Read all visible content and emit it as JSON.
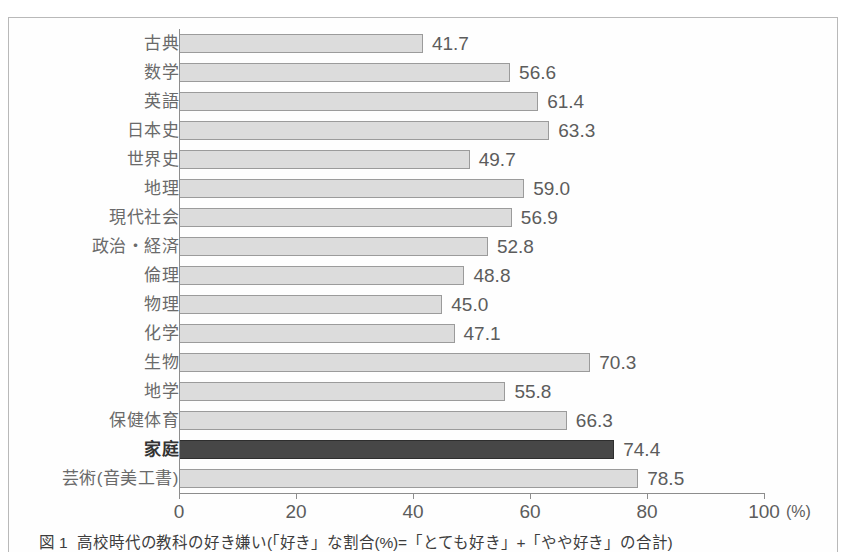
{
  "figure": {
    "caption_number": "図 1",
    "caption_text": "高校時代の教科の好き嫌い(「好き」な割合(%)=「とても好き」+「やや好き」の合計)",
    "highlight_color": "#474747",
    "bar_color": "#dcdcdc",
    "bar_border_color": "#9b9b9b",
    "axis_color": "#8d8d8d"
  },
  "chart_data": {
    "type": "bar",
    "orientation": "horizontal",
    "title": "高校時代の教科の好き嫌い(「好き」な割合(%)=「とても好き」+「やや好き」の合計)",
    "xlabel": "(%)",
    "ylabel": "",
    "xlim": [
      0,
      100
    ],
    "grid": false,
    "legend": "none",
    "unit": "(%)",
    "xticks": [
      "0",
      "20",
      "40",
      "60",
      "80",
      "100"
    ],
    "xtick_values": [
      0,
      20,
      40,
      60,
      80,
      100
    ],
    "categories": [
      "古典",
      "数学",
      "英語",
      "日本史",
      "世界史",
      "地理",
      "現代社会",
      "政治・経済",
      "倫理",
      "物理",
      "化学",
      "生物",
      "地学",
      "保健体育",
      "家庭",
      "芸術(音美工書)"
    ],
    "values": [
      41.7,
      56.6,
      61.4,
      63.3,
      49.7,
      59.0,
      56.9,
      52.8,
      48.8,
      45.0,
      47.1,
      70.3,
      55.8,
      66.3,
      74.4,
      78.5
    ],
    "value_labels": [
      "41.7",
      "56.6",
      "61.4",
      "63.3",
      "49.7",
      "59.0",
      "56.9",
      "52.8",
      "48.8",
      "45.0",
      "47.1",
      "70.3",
      "55.8",
      "66.3",
      "74.4",
      "78.5"
    ],
    "highlighted_categories": [
      "家庭"
    ],
    "highlighted_index": 14
  }
}
